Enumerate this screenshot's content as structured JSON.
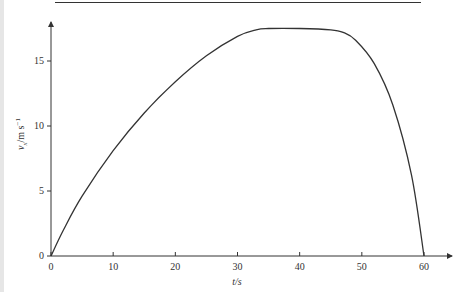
{
  "chart_data": {
    "type": "line",
    "title": "",
    "xlabel": "t/s",
    "ylabel": "v_x/m s^-1",
    "xlim": [
      0,
      60
    ],
    "ylim": [
      0,
      17.5
    ],
    "grid": false,
    "legend": null,
    "xticks": [
      "0",
      "10",
      "20",
      "30",
      "40",
      "50",
      "60"
    ],
    "yticks": [
      "0",
      "5",
      "10",
      "15"
    ],
    "series": [
      {
        "name": "v_x",
        "x": [
          0,
          2,
          5,
          10,
          15,
          20,
          25,
          30,
          33,
          35,
          40,
          45,
          47,
          49,
          52,
          55,
          58,
          60
        ],
        "y": [
          0,
          2.0,
          4.6,
          8.1,
          11.0,
          13.4,
          15.4,
          16.9,
          17.4,
          17.5,
          17.5,
          17.4,
          17.2,
          16.6,
          14.8,
          11.6,
          6.2,
          0
        ]
      }
    ]
  },
  "axes": {
    "x_tick_labels": [
      "0",
      "10",
      "20",
      "30",
      "40",
      "50",
      "60"
    ],
    "y_tick_labels": [
      "0",
      "5",
      "10",
      "15"
    ],
    "x_label": "t/s",
    "y_label_var": "v",
    "y_label_sub": "x",
    "y_label_unit": "/m s",
    "y_label_exp": "−1"
  }
}
